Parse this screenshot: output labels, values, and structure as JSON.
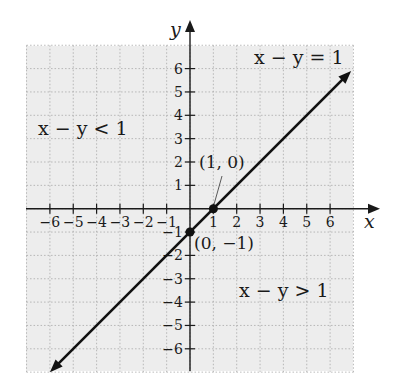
{
  "diagram": {
    "axes": {
      "x_label": "x",
      "y_label": "y",
      "x_ticks": [
        "−6",
        "−5",
        "−4",
        "−3",
        "−2",
        "−1",
        "1",
        "2",
        "3",
        "4",
        "5",
        "6"
      ],
      "y_ticks": [
        "6",
        "5",
        "4",
        "3",
        "2",
        "1",
        "−1",
        "−2",
        "−3",
        "−4",
        "−5",
        "−6"
      ],
      "range": [
        -7,
        7
      ]
    },
    "line": {
      "equation": "x − y = 1",
      "slope": 1,
      "intercept": -1
    },
    "points": [
      {
        "label": "(1, 0)",
        "x": 1,
        "y": 0
      },
      {
        "label": "(0, −1)",
        "x": 0,
        "y": -1
      }
    ],
    "regions": [
      {
        "label": "x − y < 1",
        "position": "upper-left"
      },
      {
        "label": "x − y > 1",
        "position": "lower-right"
      }
    ],
    "colors": {
      "grid_background": "#ededed",
      "grid_lines": "#a8a8a8",
      "axis": "#1a1a1a",
      "line": "#111111"
    }
  }
}
